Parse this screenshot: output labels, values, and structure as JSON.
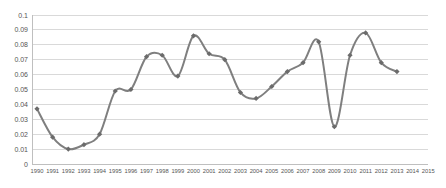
{
  "chart_data": {
    "type": "line",
    "title": "",
    "xlabel": "",
    "ylabel": "",
    "legend": false,
    "grid": true,
    "ylim": [
      0,
      0.1
    ],
    "y_tick_step": 0.01,
    "y_ticks": [
      "0.1",
      "0.09",
      "0.08",
      "0.07",
      "0.06",
      "0.05",
      "0.04",
      "0.03",
      "0.02",
      "0.01",
      "0"
    ],
    "categories": [
      "1990",
      "1991",
      "1992",
      "1993",
      "1994",
      "1995",
      "1996",
      "1997",
      "1998",
      "1999",
      "2000",
      "2001",
      "2002",
      "2003",
      "2004",
      "2005",
      "2006",
      "2007",
      "2008",
      "2009",
      "2010",
      "2011",
      "2012",
      "2013",
      "2014",
      "2015"
    ],
    "series": [
      {
        "name": "series-1",
        "smooth": true,
        "marker": "diamond",
        "line_color": "#7f7f7f",
        "marker_color": "#6b6b6b",
        "values": [
          0.037,
          0.018,
          0.01,
          0.013,
          0.02,
          0.049,
          0.05,
          0.072,
          0.073,
          0.059,
          0.086,
          0.074,
          0.07,
          0.048,
          0.044,
          0.052,
          0.062,
          0.068,
          0.082,
          0.025,
          0.073,
          0.088,
          0.068,
          0.062,
          null,
          null
        ]
      }
    ],
    "colors": {
      "gridline": "#d9d9d9",
      "axis": "#bfbfbf",
      "tick_label": "#555555",
      "background": "#ffffff"
    }
  }
}
